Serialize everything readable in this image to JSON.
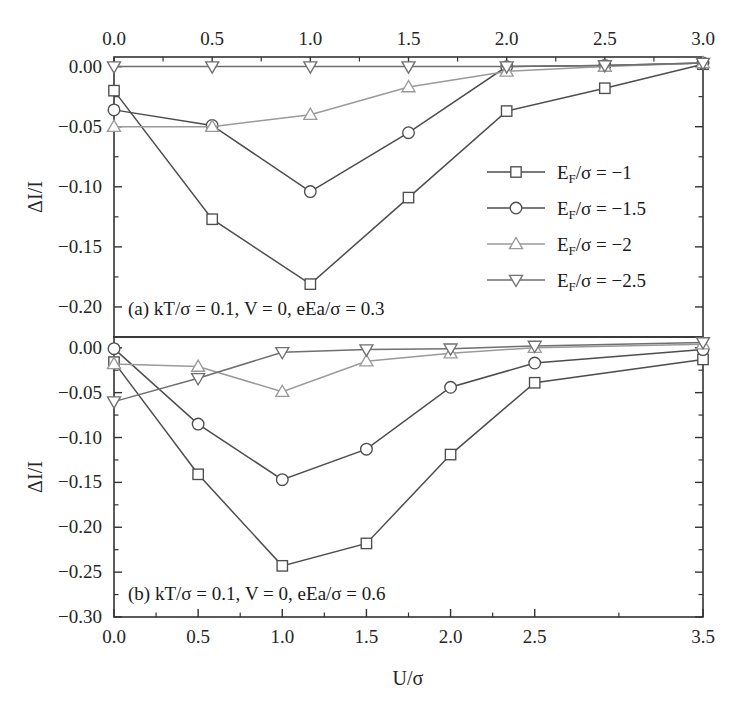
{
  "figure": {
    "ylabel_top": "ΔI/I",
    "ylabel_bottom": "ΔI/I",
    "xlabel": "U/σ"
  },
  "legend": {
    "items": [
      {
        "label": "E_F/σ = −1",
        "base": "E",
        "sub": "F",
        "rest": "/σ = −1",
        "marker": "square",
        "color": "#4d4d4d"
      },
      {
        "label": "E_F/σ = −1.5",
        "base": "E",
        "sub": "F",
        "rest": "/σ = −1.5",
        "marker": "circle",
        "color": "#4d4d4d"
      },
      {
        "label": "E_F/σ = −2",
        "base": "E",
        "sub": "F",
        "rest": "/σ = −2",
        "marker": "triangle-up",
        "color": "#9a9a9a"
      },
      {
        "label": "E_F/σ = −2.5",
        "base": "E",
        "sub": "F",
        "rest": "/σ = −2.5",
        "marker": "triangle-down",
        "color": "#6f6f6f"
      }
    ]
  },
  "chart_data": [
    {
      "type": "line",
      "panel": "a",
      "title": "(a) kT/σ = 0.1, V = 0, eEa/σ = 0.3",
      "xlabel": "",
      "ylabel": "ΔI/I",
      "x_axis_position": "top",
      "xlim": [
        0.0,
        3.0
      ],
      "ylim": [
        -0.225,
        0.008
      ],
      "xticks": [
        0.0,
        0.5,
        1.0,
        1.5,
        2.0,
        2.5,
        3.0
      ],
      "xticklabels": [
        "0.0",
        "0.5",
        "1.0",
        "1.5",
        "2.0",
        "2.5",
        "3.0"
      ],
      "yticks": [
        0.0,
        -0.05,
        -0.1,
        -0.15,
        -0.2
      ],
      "yticklabels": [
        "0.00",
        "-0.05",
        "-0.10",
        "-0.15",
        "-0.20"
      ],
      "minor_ticks": true,
      "grid": false,
      "x": [
        0.0,
        0.5,
        1.0,
        1.5,
        2.0,
        2.5,
        3.0
      ],
      "series": [
        {
          "name": "E_F/σ = −1",
          "marker": "square",
          "color": "#4d4d4d",
          "values": [
            -0.02,
            -0.127,
            -0.181,
            -0.109,
            -0.037,
            -0.018,
            0.002
          ]
        },
        {
          "name": "E_F/σ = −1.5",
          "marker": "circle",
          "color": "#4d4d4d",
          "values": [
            -0.036,
            -0.049,
            -0.104,
            -0.055,
            0.0,
            0.001,
            0.003
          ]
        },
        {
          "name": "E_F/σ = −2",
          "marker": "triangle-up",
          "color": "#9a9a9a",
          "values": [
            -0.05,
            -0.05,
            -0.04,
            -0.017,
            -0.004,
            0.0,
            0.003
          ]
        },
        {
          "name": "E_F/σ = −2.5",
          "marker": "triangle-down",
          "color": "#6f6f6f",
          "values": [
            0.0,
            0.0,
            0.0,
            0.0,
            0.0,
            0.001,
            0.003
          ]
        }
      ]
    },
    {
      "type": "line",
      "panel": "b",
      "title": "(b) kT/σ = 0.1, V = 0, eEa/σ = 0.6",
      "xlabel": "U/σ",
      "ylabel": "ΔI/I",
      "x_axis_position": "bottom",
      "xlim": [
        0.0,
        3.5
      ],
      "ylim": [
        -0.3,
        0.012
      ],
      "xticks": [
        0.0,
        0.5,
        1.0,
        1.5,
        2.0,
        2.5,
        3.5
      ],
      "xticklabels": [
        "0.0",
        "0.5",
        "1.0",
        "1.5",
        "2.0",
        "2.5",
        "3.5"
      ],
      "yticks": [
        0.0,
        -0.05,
        -0.1,
        -0.15,
        -0.2,
        -0.25,
        -0.3
      ],
      "yticklabels": [
        "0.00",
        "-0.05",
        "-0.10",
        "-0.15",
        "-0.20",
        "-0.25",
        "-0.30"
      ],
      "minor_ticks": true,
      "grid": false,
      "x": [
        0.0,
        0.5,
        1.0,
        1.5,
        2.0,
        2.5,
        3.5
      ],
      "series": [
        {
          "name": "E_F/σ = −1",
          "marker": "square",
          "color": "#4d4d4d",
          "values": [
            -0.016,
            -0.141,
            -0.243,
            -0.218,
            -0.119,
            -0.039,
            -0.013
          ]
        },
        {
          "name": "E_F/σ = −1.5",
          "marker": "circle",
          "color": "#4d4d4d",
          "values": [
            -0.001,
            -0.085,
            -0.147,
            -0.113,
            -0.044,
            -0.017,
            -0.002
          ]
        },
        {
          "name": "E_F/σ = −2",
          "marker": "triangle-up",
          "color": "#9a9a9a",
          "values": [
            -0.018,
            -0.021,
            -0.049,
            -0.015,
            -0.006,
            0.0,
            0.004
          ]
        },
        {
          "name": "E_F/σ = −2.5",
          "marker": "triangle-down",
          "color": "#6f6f6f",
          "values": [
            -0.06,
            -0.034,
            -0.005,
            -0.002,
            -0.001,
            0.002,
            0.006
          ]
        }
      ]
    }
  ]
}
